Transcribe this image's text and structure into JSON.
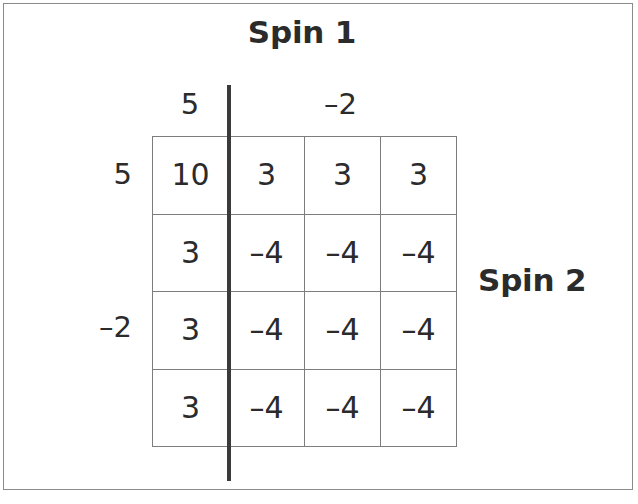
{
  "figure": {
    "title_top": "Spin 1",
    "title_right": "Spin 2"
  },
  "column_headers": [
    {
      "label": "5",
      "spans_columns": 1
    },
    {
      "label": "–2",
      "spans_columns": 3
    }
  ],
  "row_headers": [
    {
      "label": "5",
      "row_index": 0
    },
    {
      "label": "–2",
      "row_index": 2
    }
  ],
  "chart_data": {
    "type": "table",
    "title": "Spin 1",
    "xlabel": "Spin 1",
    "ylabel": "Spin 2",
    "col_categories": [
      "5",
      "–2",
      "–2",
      "–2"
    ],
    "row_categories": [
      "5",
      "–2",
      "–2",
      "–2"
    ],
    "rows": [
      [
        "10",
        "3",
        "3",
        "3"
      ],
      [
        "3",
        "–4",
        "–4",
        "–4"
      ],
      [
        "3",
        "–4",
        "–4",
        "–4"
      ],
      [
        "3",
        "–4",
        "–4",
        "–4"
      ]
    ],
    "values": [
      [
        10,
        3,
        3,
        3
      ],
      [
        3,
        -4,
        -4,
        -4
      ],
      [
        3,
        -4,
        -4,
        -4
      ],
      [
        3,
        -4,
        -4,
        -4
      ]
    ],
    "grid": true,
    "legend": "none",
    "annotations": [
      "Thick vertical divider between first column and remaining three columns"
    ]
  },
  "colors": {
    "text": "#2b2b2b",
    "grid_line": "#7d7d7d",
    "divider": "#3a3a3a",
    "frame": "#8a8a8a",
    "background": "#ffffff"
  }
}
